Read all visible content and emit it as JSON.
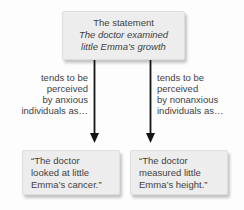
{
  "colors": {
    "background": "#fdfdfd",
    "box_fill": "#ededed",
    "box_border": "#dedede",
    "text": "#3f3f3f",
    "arrow": "#141414"
  },
  "statement_box": {
    "intro": "The statement",
    "statement_line1": "The doctor examined",
    "statement_line2": "little Emma’s growth"
  },
  "left_label": {
    "lines": [
      "tends to be",
      "perceived",
      "by anxious",
      "individuals as…"
    ]
  },
  "right_label": {
    "lines": [
      "tends to be",
      "perceived",
      "by nonanxious",
      "individuals as…"
    ]
  },
  "left_result_box": {
    "lines": [
      "“The doctor",
      "looked at little",
      "Emma’s cancer.”"
    ]
  },
  "right_result_box": {
    "lines": [
      "“The doctor",
      "measured little",
      "Emma’s height.”"
    ]
  }
}
